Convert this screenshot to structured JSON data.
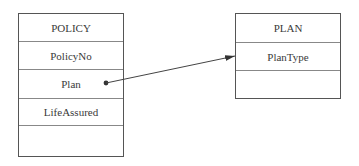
{
  "entities": {
    "policy": {
      "title": "POLICY",
      "fields": [
        "PolicyNo",
        "Plan",
        "LifeAssured",
        ""
      ]
    },
    "plan": {
      "title": "PLAN",
      "fields": [
        "PlanType",
        ""
      ]
    }
  },
  "relationships": [
    {
      "from": "POLICY.Plan",
      "to": "PLAN.PlanType",
      "style": "dot-to-arrow"
    }
  ],
  "colors": {
    "border": "#555555",
    "line": "#444444",
    "text": "#3a3a3a"
  }
}
